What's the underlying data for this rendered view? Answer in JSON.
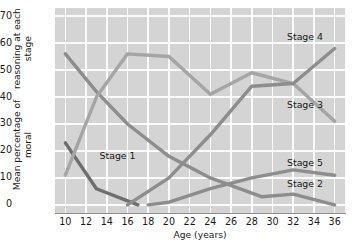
{
  "chart_data": {
    "type": "line",
    "title": "",
    "xlabel": "Age (years)",
    "ylabel_line1": "Mean percentage of moral",
    "ylabel_line2": "reasoning at each stage",
    "xlim": [
      9,
      37
    ],
    "ylim": [
      -3,
      73
    ],
    "yticks": [
      0,
      10,
      20,
      30,
      40,
      50,
      60,
      70
    ],
    "xticks": [
      10,
      12,
      14,
      16,
      18,
      20,
      22,
      24,
      26,
      28,
      30,
      32,
      34,
      36
    ],
    "grid": true,
    "legend_position": "inline-annotations",
    "plot_background": "#d4d4d4",
    "gridline_color": "#fbfbfb",
    "series": [
      {
        "name": "Stage 1",
        "color": "#6e6e6e",
        "label_x": 13.3,
        "label_y": 18.0,
        "x": [
          10,
          13,
          17
        ],
        "values": [
          23,
          6,
          0
        ]
      },
      {
        "name": "Stage 2",
        "color": "#8d8d8d",
        "label_x": 31.4,
        "label_y": 7.6,
        "x": [
          10,
          13,
          16,
          20,
          24,
          29,
          32,
          36
        ],
        "values": [
          56,
          42,
          30,
          18,
          10,
          3,
          4,
          0
        ]
      },
      {
        "name": "Stage 3",
        "color": "#a5a5a5",
        "label_x": 31.4,
        "label_y": 37.0,
        "x": [
          10,
          13,
          16,
          20,
          24,
          28,
          32,
          36
        ],
        "values": [
          11,
          40,
          56,
          55,
          41,
          49,
          45,
          31
        ]
      },
      {
        "name": "Stage 4",
        "color": "#8d8d8d",
        "label_x": 31.4,
        "label_y": 62.0,
        "x": [
          16,
          20,
          24,
          28,
          32,
          36
        ],
        "values": [
          0,
          10,
          26,
          44,
          45,
          58
        ]
      },
      {
        "name": "Stage 5",
        "color": "#8d8d8d",
        "label_x": 31.4,
        "label_y": 15.2,
        "x": [
          18,
          20,
          24,
          28,
          32,
          36
        ],
        "values": [
          0,
          1,
          6,
          10,
          13,
          11
        ]
      }
    ]
  }
}
